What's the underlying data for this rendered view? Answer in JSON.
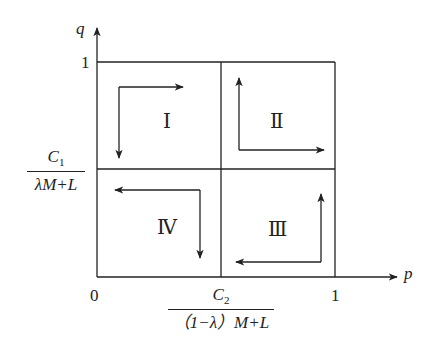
{
  "axes": {
    "x_label": "p",
    "y_label": "q",
    "origin_label": "0",
    "x_max_label": "1",
    "y_max_label": "1"
  },
  "thresholds": {
    "q_star": {
      "numerator": "C",
      "numerator_sub": "1",
      "denominator": "λM+L"
    },
    "p_star": {
      "numerator": "C",
      "numerator_sub": "2",
      "denominator": "（1−λ）M+L"
    }
  },
  "regions": [
    {
      "id": "I",
      "label": "Ⅰ",
      "arrows": [
        "right",
        "down"
      ]
    },
    {
      "id": "II",
      "label": "Ⅱ",
      "arrows": [
        "up",
        "right"
      ]
    },
    {
      "id": "III",
      "label": "Ⅲ",
      "arrows": [
        "up",
        "left"
      ]
    },
    {
      "id": "IV",
      "label": "Ⅳ",
      "arrows": [
        "left",
        "down"
      ]
    }
  ],
  "colors": {
    "line": "#222222",
    "background": "#ffffff"
  }
}
